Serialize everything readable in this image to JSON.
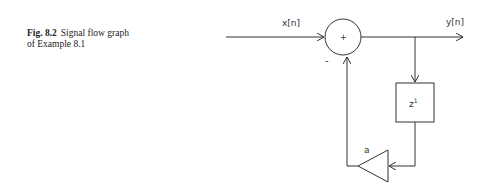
{
  "caption": {
    "label": "Fig. 8.2",
    "text_line1": "Signal flow graph",
    "text_line2": "of Example 8.1"
  },
  "diagram": {
    "input_label": "x[n]",
    "output_label": "y[n]",
    "adder_symbol": "+",
    "feedback_sign": "-",
    "delay_base": "z",
    "delay_exponent": "1",
    "gain_label": "a"
  }
}
